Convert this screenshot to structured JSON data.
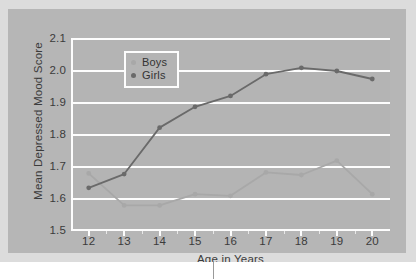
{
  "chart_data": {
    "type": "line",
    "title": "",
    "xlabel": "Age in Years",
    "ylabel": "Mean Depressed Mood Score",
    "x": [
      12,
      13,
      14,
      15,
      16,
      17,
      18,
      19,
      20
    ],
    "categories": [
      "12",
      "13",
      "14",
      "15",
      "16",
      "17",
      "18",
      "19",
      "20"
    ],
    "series": [
      {
        "name": "Boys",
        "color": "#a8a8a8",
        "values": [
          1.68,
          1.58,
          1.58,
          1.615,
          1.61,
          1.683,
          1.675,
          1.72,
          1.615
        ]
      },
      {
        "name": "Girls",
        "color": "#6a6a6a",
        "values": [
          1.635,
          1.678,
          1.823,
          1.888,
          1.922,
          1.99,
          2.01,
          2.0,
          1.975
        ]
      }
    ],
    "xlim": [
      11.5,
      20.5
    ],
    "ylim": [
      1.5,
      2.1
    ],
    "yticks": [
      "2.1",
      "2.0",
      "1.9",
      "1.8",
      "1.7",
      "1.6",
      "1.5"
    ],
    "ytick_values": [
      2.1,
      2.0,
      1.9,
      1.8,
      1.7,
      1.6,
      1.5
    ],
    "grid": true,
    "grid_color": "#fdfdfd",
    "legend_position": "upper-left",
    "plot_background": "#b4b4b4",
    "figure_background": "#b6b6b6",
    "marker": "circle"
  },
  "legend": {
    "items": [
      {
        "label": "Boys",
        "color": "#a8a8a8"
      },
      {
        "label": "Girls",
        "color": "#6a6a6a"
      }
    ]
  }
}
